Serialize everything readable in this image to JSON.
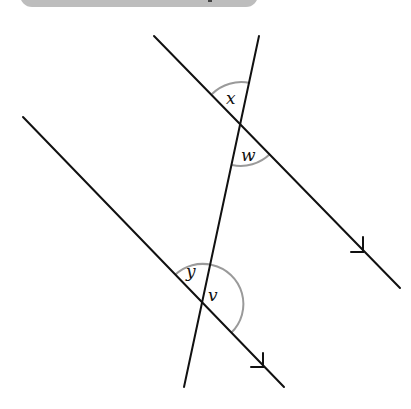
{
  "header": {
    "text": ""
  },
  "diagram": {
    "type": "parallel-lines-transversal",
    "colors": {
      "line": "#111111",
      "arc": "#9a9a9a",
      "header_box": "#bdbdbd"
    },
    "labels": {
      "x": "x",
      "w": "w",
      "y": "y",
      "v": "v"
    },
    "lines": {
      "upper_parallel": {
        "x1": 154,
        "y1": 36,
        "x2": 400,
        "y2": 288
      },
      "lower_parallel": {
        "x1": 23,
        "y1": 117,
        "x2": 284,
        "y2": 387
      },
      "transversal": {
        "x1": 259,
        "y1": 36,
        "x2": 184,
        "y2": 387
      }
    },
    "intersections": {
      "upper": {
        "x": 241,
        "y": 124
      },
      "lower": {
        "x": 203,
        "y": 304
      }
    }
  }
}
